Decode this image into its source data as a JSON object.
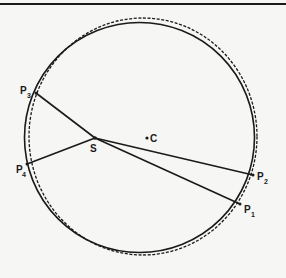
{
  "figure": {
    "type": "orbit-geometry-diagram",
    "colors": {
      "ink": "#1a1a1a",
      "background": "#f6f6f4"
    },
    "curves": [
      {
        "name": "solid-circle",
        "style": "solid"
      },
      {
        "name": "dashed-circle",
        "style": "dashed"
      }
    ],
    "points": {
      "S": {
        "label": "S",
        "subscript": ""
      },
      "C": {
        "label": "C",
        "subscript": ""
      },
      "P1": {
        "label": "P",
        "subscript": "1"
      },
      "P2": {
        "label": "P",
        "subscript": "2"
      },
      "P3": {
        "label": "P",
        "subscript": "3"
      },
      "P4": {
        "label": "P",
        "subscript": "4"
      }
    },
    "segments": [
      {
        "from": "S",
        "to": "P1"
      },
      {
        "from": "S",
        "to": "P2"
      },
      {
        "from": "S",
        "to": "P3"
      },
      {
        "from": "S",
        "to": "P4"
      }
    ]
  }
}
